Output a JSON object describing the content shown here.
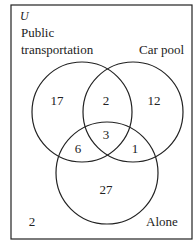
{
  "universe_label": "U",
  "sets": {
    "public": {
      "label_line1": "Public",
      "label_line2": "transportation"
    },
    "carpool": {
      "label": "Car pool"
    },
    "alone": {
      "label": "Alone"
    }
  },
  "regions": {
    "public_only": "17",
    "public_carpool_only": "2",
    "carpool_only": "12",
    "all_three": "3",
    "public_alone_only": "6",
    "carpool_alone_only": "1",
    "alone_only": "27",
    "none": "2"
  }
}
